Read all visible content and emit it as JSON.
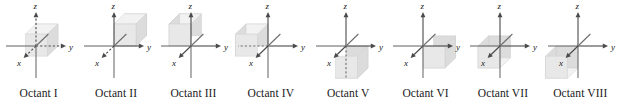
{
  "figure": {
    "axis_labels": {
      "x": "x",
      "y": "y",
      "z": "z"
    },
    "colors": {
      "axis": "#6e6e6e",
      "axis_dark": "#4a4a4a",
      "cube_front": "#e8e8e8",
      "cube_top": "#f2f2f2",
      "cube_side": "#dcdcdc",
      "cube_edge": "#cfcfcf",
      "text": "#1a1a1a"
    },
    "panels": [
      {
        "id": "octant-1",
        "caption": "Octant I",
        "signs": {
          "x": "+",
          "y": "+",
          "z": "+"
        },
        "cube": {
          "dx": 1,
          "dy": 1,
          "dz": 1
        },
        "hidden_axes": [
          "z-positive",
          "y-positive",
          "x-positive"
        ]
      },
      {
        "id": "octant-2",
        "caption": "Octant II",
        "signs": {
          "x": "-",
          "y": "+",
          "z": "+"
        },
        "cube": {
          "dx": -1,
          "dy": 1,
          "dz": 1
        },
        "hidden_axes": [
          "x-positive"
        ]
      },
      {
        "id": "octant-3",
        "caption": "Octant III",
        "signs": {
          "x": "-",
          "y": "-",
          "z": "+"
        },
        "cube": {
          "dx": -1,
          "dy": -1,
          "dz": 1
        },
        "hidden_axes": []
      },
      {
        "id": "octant-4",
        "caption": "Octant IV",
        "signs": {
          "x": "+",
          "y": "-",
          "z": "+"
        },
        "cube": {
          "dx": 1,
          "dy": -1,
          "dz": 1
        },
        "hidden_axes": [
          "y-negative"
        ]
      },
      {
        "id": "octant-5",
        "caption": "Octant V",
        "signs": {
          "x": "+",
          "y": "+",
          "z": "-"
        },
        "cube": {
          "dx": 1,
          "dy": 1,
          "dz": -1
        },
        "hidden_axes": [
          "z-negative"
        ]
      },
      {
        "id": "octant-6",
        "caption": "Octant VI",
        "signs": {
          "x": "-",
          "y": "+",
          "z": "-"
        },
        "cube": {
          "dx": -1,
          "dy": 1,
          "dz": -1
        },
        "hidden_axes": []
      },
      {
        "id": "octant-7",
        "caption": "Octant VII",
        "signs": {
          "x": "-",
          "y": "-",
          "z": "-"
        },
        "cube": {
          "dx": -1,
          "dy": -1,
          "dz": -1
        },
        "hidden_axes": []
      },
      {
        "id": "octant-8",
        "caption": "Octant VIII",
        "signs": {
          "x": "+",
          "y": "-",
          "z": "-"
        },
        "cube": {
          "dx": 1,
          "dy": -1,
          "dz": -1
        },
        "hidden_axes": []
      }
    ]
  }
}
